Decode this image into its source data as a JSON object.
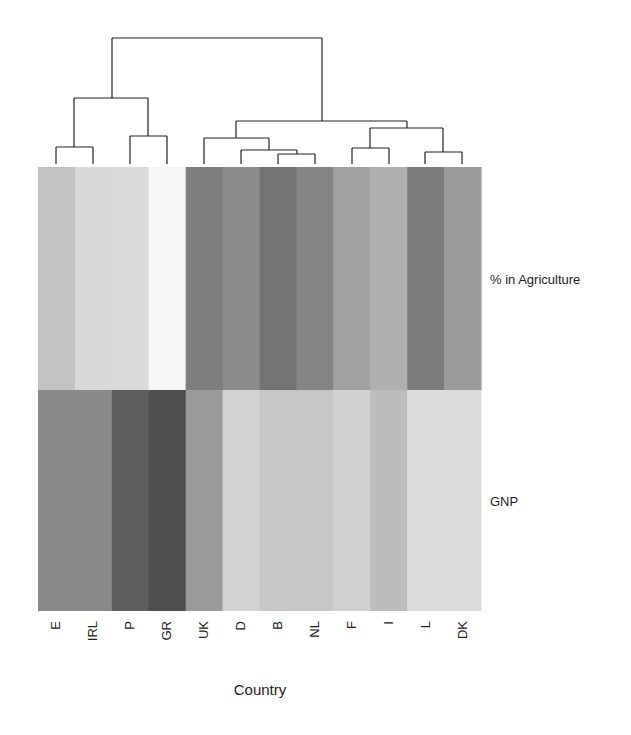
{
  "chart_data": {
    "type": "heatmap",
    "title": "",
    "xlabel": "Country",
    "ylabel": "",
    "x_categories": [
      "E",
      "IRL",
      "P",
      "GR",
      "UK",
      "D",
      "B",
      "NL",
      "F",
      "I",
      "L",
      "DK"
    ],
    "y_categories": [
      "% in Agriculture",
      "GNP"
    ],
    "colormap": "grayscale (light = low, dark = high, relative)",
    "cell_gray_hex": [
      [
        "#c2c2c2",
        "#d8d8d8",
        "#dadada",
        "#f6f6f6",
        "#7e7e7e",
        "#8c8c8c",
        "#737373",
        "#858585",
        "#a0a0a0",
        "#b0b0b0",
        "#7c7c7c",
        "#9a9a9a"
      ],
      [
        "#8a8a8a",
        "#8a8a8a",
        "#5e5e5e",
        "#4e4e4e",
        "#9a9a9a",
        "#d2d2d2",
        "#c6c6c6",
        "#c6c6c6",
        "#d0d0d0",
        "#bcbcbc",
        "#dcdcdc",
        "#dcdcdc"
      ]
    ],
    "dendrogram": {
      "position": "top (column clustering)",
      "clusters": [
        [
          "E",
          "IRL"
        ],
        [
          "P",
          "GR"
        ],
        [
          [
            "E",
            "IRL"
          ],
          [
            "P",
            "GR"
          ]
        ],
        [
          "B",
          "NL"
        ],
        [
          "D",
          [
            "B",
            "NL"
          ]
        ],
        [
          "UK",
          [
            "D",
            [
              "B",
              "NL"
            ]
          ]
        ],
        [
          "F",
          "I"
        ],
        [
          "L",
          "DK"
        ],
        [
          [
            "F",
            "I"
          ],
          [
            "L",
            "DK"
          ]
        ],
        [
          [
            "UK",
            "D",
            "B",
            "NL"
          ],
          [
            "F",
            "I",
            "L",
            "DK"
          ]
        ],
        [
          [
            "E",
            "IRL",
            "P",
            "GR"
          ],
          [
            "UK",
            "D",
            "B",
            "NL",
            "F",
            "I",
            "L",
            "DK"
          ]
        ]
      ]
    },
    "legend": "none",
    "grid": false
  }
}
